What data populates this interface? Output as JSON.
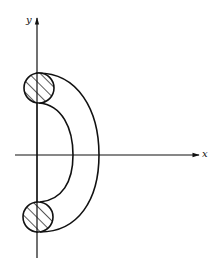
{
  "diagram": {
    "axes": {
      "x_label": "x",
      "y_label": "y"
    },
    "colors": {
      "stroke": "#111111",
      "background": "#ffffff"
    },
    "cross_sections": [
      {
        "name": "top",
        "hatched": true
      },
      {
        "name": "bottom",
        "hatched": true
      }
    ]
  }
}
